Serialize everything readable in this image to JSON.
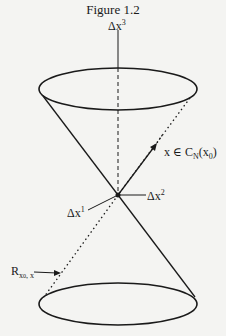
{
  "figure": {
    "title": "Figure 1.2"
  },
  "labels": {
    "axis_vertical": {
      "base": "Δx",
      "sup": "3"
    },
    "axis_horizontal": {
      "base": "Δx",
      "sup": "2"
    },
    "axis_depth": {
      "base": "Δx",
      "sup": "1"
    },
    "vector": {
      "prefix": "x ∈ C",
      "sub": "N",
      "suffix": "(x",
      "sub2": "0",
      "close": ")"
    },
    "ray": {
      "base": "R",
      "sub": "x",
      "subsub": "0",
      "subrest": ", x"
    }
  },
  "colors": {
    "ink": "#1a1a1a",
    "background": "#f4f4f2"
  },
  "geometry": {
    "apex": [
      118,
      195
    ],
    "top_ellipse": {
      "cx": 118,
      "cy": 89,
      "rx": 79,
      "ry": 21
    },
    "bottom_ellipse": {
      "cx": 118,
      "cy": 304,
      "rx": 79,
      "ry": 21
    }
  }
}
